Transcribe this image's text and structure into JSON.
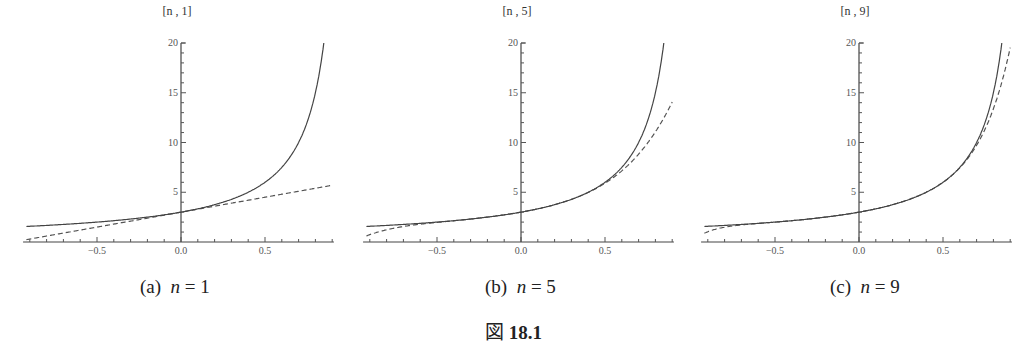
{
  "figure": {
    "caption_prefix": "図",
    "caption_number": "18.1"
  },
  "chart_data": [
    {
      "type": "line",
      "panel_label": "(a)",
      "caption_var": "n",
      "caption_eq": " = 1",
      "ylabel": "[n , 1]",
      "xlabel": "",
      "xlim": [
        -0.94,
        0.91
      ],
      "ylim": [
        0,
        20
      ],
      "xticks": [
        -0.5,
        0.0,
        0.5
      ],
      "xtick_labels": [
        "-0.5",
        "0.0",
        "0.5"
      ],
      "yticks": [
        5,
        10,
        15,
        20
      ],
      "ytick_labels": [
        "5",
        "10",
        "15",
        "20"
      ],
      "grid": false,
      "series": [
        {
          "name": "f(x) = 3/(1-x)",
          "style": "solid",
          "x": [
            -0.9,
            -0.5,
            0.0,
            0.5,
            0.7,
            0.8,
            0.85
          ],
          "y": [
            1.58,
            2.0,
            3.0,
            6.0,
            10.0,
            15.0,
            20.0
          ]
        },
        {
          "name": "degree-1 approximation",
          "style": "dashed",
          "x": [
            -0.9,
            0.0,
            0.9
          ],
          "y": [
            0.3,
            3.0,
            5.7
          ]
        }
      ],
      "degree": 1
    },
    {
      "type": "line",
      "panel_label": "(b)",
      "caption_var": "n",
      "caption_eq": " = 5",
      "ylabel": "[n , 5]",
      "xlabel": "",
      "xlim": [
        -0.94,
        0.91
      ],
      "ylim": [
        0,
        20
      ],
      "xticks": [
        -0.5,
        0.0,
        0.5
      ],
      "xtick_labels": [
        "-0.5",
        "0.0",
        "0.5"
      ],
      "yticks": [
        5,
        10,
        15,
        20
      ],
      "ytick_labels": [
        "5",
        "10",
        "15",
        "20"
      ],
      "grid": false,
      "series": [
        {
          "name": "f(x) = 3/(1-x)",
          "style": "solid",
          "x": [
            -0.9,
            -0.5,
            0.0,
            0.5,
            0.7,
            0.8,
            0.85
          ],
          "y": [
            1.58,
            2.0,
            3.0,
            6.0,
            10.0,
            15.0,
            20.0
          ]
        },
        {
          "name": "degree-5 approximation",
          "style": "dashed",
          "x": [
            -0.9,
            -0.5,
            0.0,
            0.5,
            0.9
          ],
          "y": [
            1.06,
            1.97,
            3.0,
            5.91,
            14.15
          ]
        }
      ],
      "degree": 5
    },
    {
      "type": "line",
      "panel_label": "(c)",
      "caption_var": "n",
      "caption_eq": " = 9",
      "ylabel": "[n , 9]",
      "xlabel": "",
      "xlim": [
        -0.94,
        0.91
      ],
      "ylim": [
        0,
        20
      ],
      "xticks": [
        -0.5,
        0.0,
        0.5
      ],
      "xtick_labels": [
        "-0.5",
        "0.0",
        "0.5"
      ],
      "yticks": [
        5,
        10,
        15,
        20
      ],
      "ytick_labels": [
        "5",
        "10",
        "15",
        "20"
      ],
      "grid": false,
      "series": [
        {
          "name": "f(x) = 3/(1-x)",
          "style": "solid",
          "x": [
            -0.9,
            -0.5,
            0.0,
            0.5,
            0.7,
            0.8,
            0.85
          ],
          "y": [
            1.58,
            2.0,
            3.0,
            6.0,
            10.0,
            15.0,
            20.0
          ]
        },
        {
          "name": "degree-9 approximation",
          "style": "dashed",
          "x": [
            -0.9,
            -0.5,
            0.0,
            0.5,
            0.9
          ],
          "y": [
            1.38,
            2.0,
            3.0,
            5.99,
            19.5
          ]
        }
      ],
      "degree": 9
    }
  ]
}
